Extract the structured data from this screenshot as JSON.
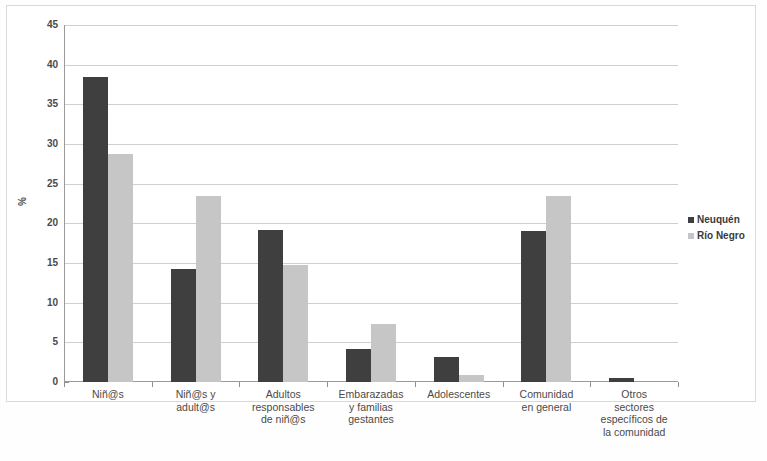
{
  "chart_data": {
    "type": "bar",
    "title": "",
    "xlabel": "",
    "ylabel": "%",
    "ylim": [
      0,
      45
    ],
    "ytick_step": 5,
    "yticks": [
      "45",
      "40",
      "35",
      "30",
      "25",
      "20",
      "15",
      "10",
      "5",
      "0"
    ],
    "grid": true,
    "legend_position": "right",
    "categories": [
      "Niñ@s",
      "Niñ@s y adult@s",
      "Adultos responsables de niñ@s",
      "Embarazadas y familias gestantes",
      "Adolescentes",
      "Comunidad en general",
      "Otros sectores específicos de la comunidad"
    ],
    "category_lines": [
      [
        "Niñ@s"
      ],
      [
        "Niñ@s y",
        "adult@s"
      ],
      [
        "Adultos",
        "responsables",
        "de niñ@s"
      ],
      [
        "Embarazadas",
        "y familias",
        "gestantes"
      ],
      [
        "Adolescentes"
      ],
      [
        "Comunidad",
        "en general"
      ],
      [
        "Otros",
        "sectores",
        "específicos de",
        "la comunidad"
      ]
    ],
    "series": [
      {
        "name": "Neuquén",
        "color": "#3f3f3f",
        "values": [
          38.5,
          14.2,
          19.1,
          4.2,
          3.1,
          19.0,
          0.5
        ]
      },
      {
        "name": "Río Negro",
        "color": "#c6c6c6",
        "values": [
          28.7,
          23.5,
          14.8,
          7.3,
          0.9,
          23.4,
          0
        ]
      }
    ]
  },
  "legend": {
    "items": [
      {
        "label": "Neuquén",
        "swatch": "neuquen"
      },
      {
        "label": "Río Negro",
        "swatch": "rionegro"
      }
    ]
  }
}
